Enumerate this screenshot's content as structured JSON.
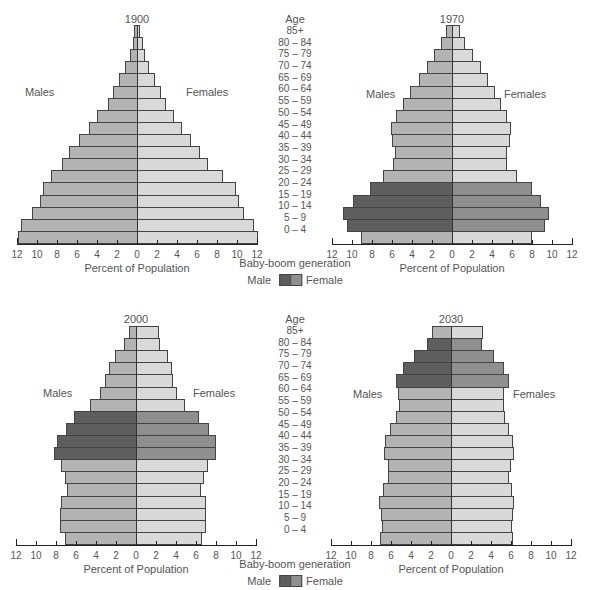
{
  "age_groups": [
    "85+",
    "80 – 84",
    "75 – 79",
    "70 – 74",
    "65 – 69",
    "60 – 64",
    "55 – 59",
    "50 – 54",
    "45 – 49",
    "40 – 44",
    "35 – 39",
    "30 – 34",
    "25 – 29",
    "20 – 24",
    "15 – 19",
    "10 – 14",
    "5 – 9",
    "0 – 4"
  ],
  "labels": {
    "age_title": "Age",
    "males": "Males",
    "females": "Females",
    "xlabel": "Percent of Population",
    "baby_boom": "Baby-boom generation",
    "legend_male": "Male",
    "legend_female": "Female"
  },
  "colors": {
    "male": "#b3b3b3",
    "female": "#d9d9d9",
    "male_boom": "#5e5e5e",
    "female_boom": "#8f8f8f"
  },
  "chart_data": [
    {
      "type": "bar",
      "orientation": "horizontal-population-pyramid",
      "title": "1900",
      "xlabel": "Percent of Population",
      "ylabel": "Age",
      "xticks": [
        12,
        10,
        8,
        6,
        4,
        2,
        0,
        2,
        4,
        6,
        8,
        10,
        12
      ],
      "xlim": [
        -12,
        12
      ],
      "categories": [
        "85+",
        "80-84",
        "75-79",
        "70-74",
        "65-69",
        "60-64",
        "55-59",
        "50-54",
        "45-49",
        "40-44",
        "35-39",
        "30-34",
        "25-29",
        "20-24",
        "15-19",
        "10-14",
        "5-9",
        "0-4"
      ],
      "series": [
        {
          "name": "Males",
          "values": [
            0.3,
            0.4,
            0.7,
            1.2,
            1.8,
            2.4,
            2.9,
            4.0,
            4.8,
            5.8,
            6.8,
            7.5,
            8.6,
            9.4,
            9.7,
            10.5,
            11.6,
            11.9
          ]
        },
        {
          "name": "Females",
          "values": [
            0.3,
            0.6,
            0.8,
            1.2,
            1.8,
            2.4,
            2.9,
            3.7,
            4.5,
            5.4,
            6.3,
            7.1,
            8.6,
            9.9,
            10.2,
            10.7,
            11.7,
            12.1
          ]
        }
      ],
      "baby_boom_rows": []
    },
    {
      "type": "bar",
      "orientation": "horizontal-population-pyramid",
      "title": "1970",
      "xlabel": "Percent of Population",
      "ylabel": "Age",
      "xticks": [
        12,
        10,
        8,
        6,
        4,
        2,
        0,
        2,
        4,
        6,
        8,
        10,
        12
      ],
      "xlim": [
        -12,
        12
      ],
      "categories": [
        "85+",
        "80-84",
        "75-79",
        "70-74",
        "65-69",
        "60-64",
        "55-59",
        "50-54",
        "45-49",
        "40-44",
        "35-39",
        "30-34",
        "25-29",
        "20-24",
        "15-19",
        "10-14",
        "5-9",
        "0-4"
      ],
      "series": [
        {
          "name": "Males",
          "values": [
            0.6,
            1.1,
            1.8,
            2.5,
            3.3,
            4.2,
            4.9,
            5.6,
            6.1,
            6.0,
            5.7,
            5.9,
            6.9,
            8.2,
            9.9,
            10.9,
            10.5,
            9.1
          ]
        },
        {
          "name": "Females",
          "values": [
            0.8,
            1.3,
            2.1,
            2.9,
            3.6,
            4.3,
            4.9,
            5.5,
            5.9,
            5.8,
            5.5,
            5.5,
            6.5,
            8.0,
            8.9,
            9.7,
            9.3,
            8.0
          ]
        }
      ],
      "baby_boom_rows": [
        "20-24",
        "15-19",
        "10-14",
        "5-9"
      ]
    },
    {
      "type": "bar",
      "orientation": "horizontal-population-pyramid",
      "title": "2000",
      "xlabel": "Percent of Population",
      "ylabel": "Age",
      "xticks": [
        12,
        10,
        8,
        6,
        4,
        2,
        0,
        2,
        4,
        6,
        8,
        10,
        12
      ],
      "xlim": [
        -12,
        12
      ],
      "categories": [
        "85+",
        "80-84",
        "75-79",
        "70-74",
        "65-69",
        "60-64",
        "55-59",
        "50-54",
        "45-49",
        "40-44",
        "35-39",
        "30-34",
        "25-29",
        "20-24",
        "15-19",
        "10-14",
        "5-9",
        "0-4"
      ],
      "series": [
        {
          "name": "Males",
          "values": [
            0.7,
            1.2,
            2.1,
            2.7,
            3.1,
            3.6,
            4.6,
            6.2,
            7.0,
            7.9,
            8.2,
            7.5,
            7.1,
            6.9,
            7.5,
            7.6,
            7.6,
            7.1
          ]
        },
        {
          "name": "Females",
          "values": [
            2.3,
            2.4,
            3.2,
            3.6,
            3.7,
            4.1,
            4.9,
            6.3,
            7.3,
            8.0,
            8.0,
            7.2,
            6.8,
            6.5,
            7.0,
            7.0,
            7.0,
            6.6
          ]
        }
      ],
      "baby_boom_rows": [
        "50-54",
        "45-49",
        "40-44",
        "35-39"
      ]
    },
    {
      "type": "bar",
      "orientation": "horizontal-population-pyramid",
      "title": "2030",
      "xlabel": "Percent of Population",
      "ylabel": "Age",
      "xticks": [
        12,
        10,
        8,
        6,
        4,
        2,
        0,
        2,
        4,
        6,
        8,
        10,
        12
      ],
      "xlim": [
        -12,
        12
      ],
      "categories": [
        "85+",
        "80-84",
        "75-79",
        "70-74",
        "65-69",
        "60-64",
        "55-59",
        "50-54",
        "45-49",
        "40-44",
        "35-39",
        "30-34",
        "25-29",
        "20-24",
        "15-19",
        "10-14",
        "5-9",
        "0-4"
      ],
      "series": [
        {
          "name": "Males",
          "values": [
            1.9,
            2.4,
            3.7,
            4.8,
            5.5,
            5.3,
            5.2,
            5.5,
            6.1,
            6.6,
            6.7,
            6.3,
            6.3,
            6.8,
            7.2,
            7.0,
            6.9,
            7.1
          ]
        },
        {
          "name": "Females",
          "values": [
            3.2,
            3.1,
            4.3,
            5.3,
            5.8,
            5.3,
            5.3,
            5.4,
            5.8,
            6.2,
            6.3,
            6.0,
            5.8,
            6.1,
            6.3,
            6.2,
            6.1,
            6.2
          ]
        }
      ],
      "baby_boom_rows": [
        "80-84",
        "75-79",
        "70-74",
        "65-69"
      ]
    }
  ]
}
